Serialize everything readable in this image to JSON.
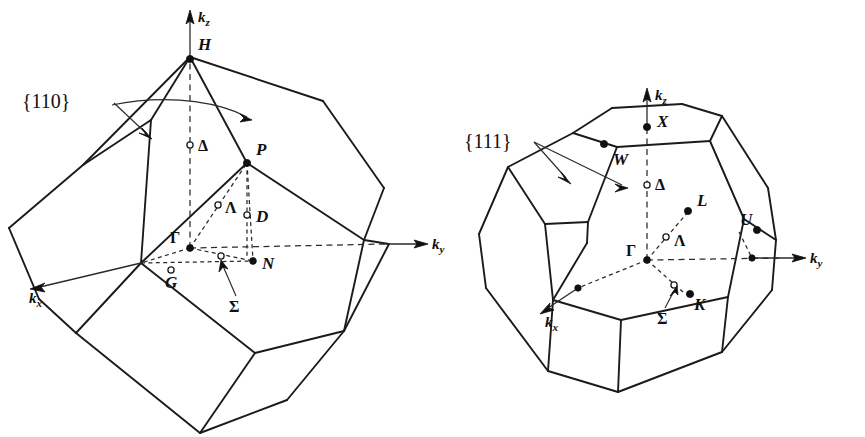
{
  "figure": {
    "background_color": "#ffffff",
    "line_color": "#1b1b1b",
    "panels": [
      {
        "id": "bcc",
        "name": "body-centred-cubic-brillouin-zone",
        "shape": "truncated octahedron",
        "plane_label": "{110}",
        "axes": [
          {
            "id": "kz",
            "base": "k",
            "sub": "z"
          },
          {
            "id": "ky",
            "base": "k",
            "sub": "y"
          },
          {
            "id": "kx",
            "base": "k",
            "sub": "x"
          }
        ],
        "points": [
          {
            "label": "H",
            "kind": "filled"
          },
          {
            "label": "P",
            "kind": "filled"
          },
          {
            "label": "N",
            "kind": "filled"
          },
          {
            "label": "Γ",
            "kind": "filled"
          },
          {
            "label": "Δ",
            "kind": "open"
          },
          {
            "label": "Λ",
            "kind": "open"
          },
          {
            "label": "D",
            "kind": "open"
          },
          {
            "label": "G",
            "kind": "open"
          },
          {
            "label": "Σ",
            "kind": "open"
          }
        ]
      },
      {
        "id": "fcc",
        "name": "face-centred-cubic-brillouin-zone",
        "shape": "truncated octahedron",
        "plane_label": "{111}",
        "axes": [
          {
            "id": "kz",
            "base": "k",
            "sub": "z"
          },
          {
            "id": "ky",
            "base": "k",
            "sub": "y"
          },
          {
            "id": "kx",
            "base": "k",
            "sub": "x"
          }
        ],
        "points": [
          {
            "label": "X",
            "kind": "filled"
          },
          {
            "label": "W",
            "kind": "filled"
          },
          {
            "label": "L",
            "kind": "filled"
          },
          {
            "label": "U",
            "kind": "filled"
          },
          {
            "label": "K",
            "kind": "filled"
          },
          {
            "label": "Γ",
            "kind": "filled"
          },
          {
            "label": "Δ",
            "kind": "open"
          },
          {
            "label": "Λ",
            "kind": "open"
          },
          {
            "label": "Σ",
            "kind": "open"
          }
        ]
      }
    ]
  },
  "labels": {
    "bcc": {
      "plane": "{110}",
      "H": "H",
      "P": "P",
      "N": "N",
      "Gamma": "Γ",
      "Delta": "Δ",
      "Lambda": "Λ",
      "D": "D",
      "G": "G",
      "Sigma": "Σ",
      "k": "k",
      "z": "z",
      "y": "y",
      "x": "x"
    },
    "fcc": {
      "plane": "{111}",
      "X": "X",
      "W": "W",
      "L": "L",
      "U": "U",
      "K": "K",
      "Gamma": "Γ",
      "Delta": "Δ",
      "Lambda": "Λ",
      "Sigma": "Σ",
      "k": "k",
      "z": "z",
      "y": "y",
      "x": "x"
    }
  }
}
